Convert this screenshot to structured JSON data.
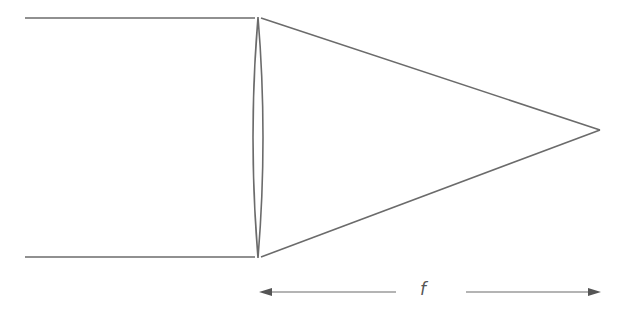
{
  "diagram": {
    "colors": {
      "line": "#6b6b6b",
      "background": "#ffffff"
    },
    "labels": {
      "focal_length": "f"
    },
    "elements": {
      "incoming_rays": [
        {
          "x1": 25,
          "y1": 18,
          "x2": 255,
          "y2": 18
        },
        {
          "x1": 25,
          "y1": 257,
          "x2": 255,
          "y2": 257
        }
      ],
      "lens": {
        "cx": 258,
        "top": 17,
        "bottom": 258,
        "half_width": 7
      },
      "converging_rays": [
        {
          "x1": 261,
          "y1": 18,
          "x2": 600,
          "y2": 130
        },
        {
          "x1": 261,
          "y1": 257,
          "x2": 600,
          "y2": 130
        }
      ],
      "focal_point": {
        "x": 600,
        "y": 130
      },
      "dimension_arrow": {
        "y": 292,
        "x_start": 260,
        "x_end": 600,
        "gap_start": 396,
        "gap_end": 466
      }
    }
  }
}
